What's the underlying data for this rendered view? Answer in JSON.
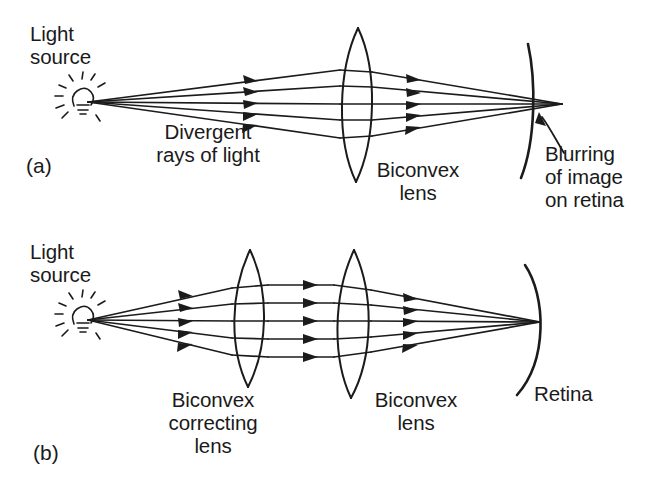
{
  "figure": {
    "background_color": "#ffffff",
    "ink_color": "#1b1b1b"
  },
  "panels": [
    {
      "id": "a",
      "label": "(a)",
      "description": "Uncorrected eye: divergent rays of light from a light source pass through the biconvex lens of the eye and fail to converge on the retina, producing a blurred image.",
      "labels": {
        "light_source": "Light\nsource",
        "divergent_rays": "Divergent\nrays of light",
        "biconvex_lens": "Biconvex\nlens",
        "blurring": "Blurring\nof image\non retina"
      },
      "elements": {
        "light_source_icon": "light-bulb-icon",
        "ray_count": 5,
        "lens_count": 1,
        "retina": "retina-arc",
        "focus_behind_retina": true
      }
    },
    {
      "id": "b",
      "label": "(b)",
      "description": "Corrected eye: a biconvex correcting lens renders the divergent rays parallel so the biconvex lens of the eye focuses them exactly on the retina.",
      "labels": {
        "light_source": "Light\nsource",
        "correcting_lens": "Biconvex\ncorrecting\nlens",
        "biconvex_lens": "Biconvex\nlens",
        "retina": "Retina"
      },
      "elements": {
        "light_source_icon": "light-bulb-icon",
        "ray_count": 5,
        "lens_count": 2,
        "retina": "retina-arc",
        "focus_on_retina": true
      }
    }
  ]
}
